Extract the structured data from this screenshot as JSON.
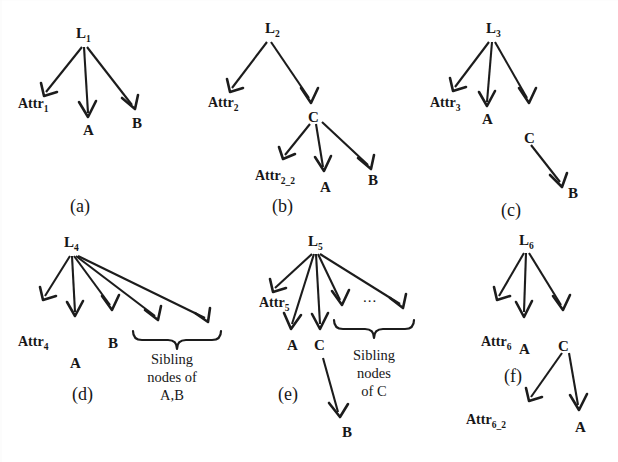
{
  "figure": {
    "background_color": "#ffffff",
    "ink_color": "#1c1c1c"
  },
  "panels": [
    {
      "id": "a",
      "caption": "(a)",
      "root": "L",
      "root_sub": "1",
      "nodes": [
        {
          "key": "attr",
          "text": "Attr",
          "sub": "1"
        },
        {
          "key": "a",
          "text": "A",
          "sub": ""
        },
        {
          "key": "b",
          "text": "B",
          "sub": ""
        }
      ]
    },
    {
      "id": "b",
      "caption": "(b)",
      "root": "L",
      "root_sub": "2",
      "nodes": [
        {
          "key": "attr",
          "text": "Attr",
          "sub": "2"
        },
        {
          "key": "c",
          "text": "C",
          "sub": ""
        },
        {
          "key": "attr2",
          "text": "Attr",
          "sub": "2_2"
        },
        {
          "key": "a",
          "text": "A",
          "sub": ""
        },
        {
          "key": "b",
          "text": "B",
          "sub": ""
        }
      ]
    },
    {
      "id": "c",
      "caption": "(c)",
      "root": "L",
      "root_sub": "3",
      "nodes": [
        {
          "key": "attr",
          "text": "Attr",
          "sub": "3"
        },
        {
          "key": "a",
          "text": "A",
          "sub": ""
        },
        {
          "key": "c",
          "text": "C",
          "sub": ""
        },
        {
          "key": "b",
          "text": "B",
          "sub": ""
        }
      ]
    },
    {
      "id": "d",
      "caption": "(d)",
      "root": "L",
      "root_sub": "4",
      "nodes": [
        {
          "key": "attr",
          "text": "Attr",
          "sub": "4"
        },
        {
          "key": "a",
          "text": "A",
          "sub": ""
        },
        {
          "key": "b",
          "text": "B",
          "sub": ""
        }
      ],
      "brace_label_lines": [
        "Sibling",
        "nodes of",
        "A,B"
      ]
    },
    {
      "id": "e",
      "caption": "(e)",
      "root": "L",
      "root_sub": "5",
      "nodes": [
        {
          "key": "attr",
          "text": "Attr",
          "sub": "5"
        },
        {
          "key": "a",
          "text": "A",
          "sub": ""
        },
        {
          "key": "c",
          "text": "C",
          "sub": ""
        },
        {
          "key": "b",
          "text": "B",
          "sub": ""
        }
      ],
      "ellipsis": "...",
      "brace_label_lines": [
        "Sibling",
        "nodes",
        "of C"
      ]
    },
    {
      "id": "f",
      "caption": "(f)",
      "root": "L",
      "root_sub": "6",
      "nodes": [
        {
          "key": "attr",
          "text": "Attr",
          "sub": "6"
        },
        {
          "key": "a",
          "text": "A",
          "sub": ""
        },
        {
          "key": "c",
          "text": "C",
          "sub": ""
        },
        {
          "key": "attr2",
          "text": "Attr",
          "sub": "6_2"
        },
        {
          "key": "a2",
          "text": "A",
          "sub": ""
        }
      ]
    }
  ]
}
